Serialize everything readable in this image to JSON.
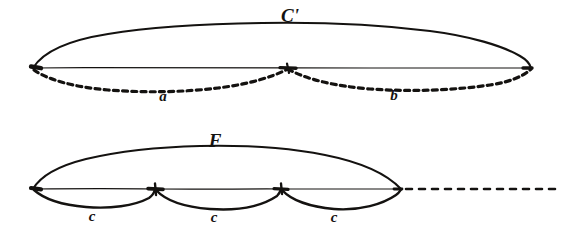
{
  "figure": {
    "title_visible": false,
    "style": "vintage engraving line drawing",
    "ink_color": "#141210",
    "background_color": "#ffffff",
    "width": 568,
    "height": 230
  },
  "diagrams": [
    {
      "id": "upper-diagram",
      "name": "upper-vibration-figure",
      "main_label": "C'",
      "main_label_position": {
        "x": 290,
        "y": 22
      },
      "axis": {
        "x1": 33,
        "y1": 68,
        "x2": 531,
        "y2": 68
      },
      "nodes": [
        {
          "name": "left-vertex",
          "x": 33,
          "y": 68
        },
        {
          "name": "center-node",
          "x": 288,
          "y": 68
        },
        {
          "name": "right-vertex",
          "x": 531,
          "y": 68
        }
      ],
      "solid_arc": {
        "name": "upper-solid-arc",
        "description": "single solid arc above the axis spanning full width"
      },
      "dashed_arcs": [
        {
          "name": "dashed-arc-a",
          "label": "a",
          "label_position": {
            "x": 163,
            "y": 99
          }
        },
        {
          "name": "dashed-arc-b",
          "label": "b",
          "label_position": {
            "x": 394,
            "y": 98
          }
        }
      ]
    },
    {
      "id": "lower-diagram",
      "name": "lower-vibration-figure",
      "main_label": "F",
      "main_label_position": {
        "x": 215,
        "y": 145
      },
      "axis": {
        "x1": 33,
        "y1": 189,
        "x2": 401,
        "y2": 189
      },
      "nodes": [
        {
          "name": "left-vertex",
          "x": 33,
          "y": 189
        },
        {
          "name": "node-1",
          "x": 155,
          "y": 189
        },
        {
          "name": "node-2",
          "x": 281,
          "y": 189
        },
        {
          "name": "right-vertex",
          "x": 401,
          "y": 189
        }
      ],
      "solid_arc": {
        "name": "lower-solid-arc",
        "description": "single solid arc above the axis spanning to right vertex"
      },
      "lower_arcs": [
        {
          "name": "lower-arc-c-1",
          "label": "c",
          "label_position": {
            "x": 92,
            "y": 218
          }
        },
        {
          "name": "lower-arc-c-2",
          "label": "c",
          "label_position": {
            "x": 214,
            "y": 219
          }
        },
        {
          "name": "lower-arc-c-3",
          "label": "c",
          "label_position": {
            "x": 334,
            "y": 219
          }
        }
      ],
      "dashed_extension": {
        "name": "dashed-axis-extension",
        "x1": 405,
        "y1": 189,
        "x2": 560,
        "y2": 189
      }
    }
  ]
}
